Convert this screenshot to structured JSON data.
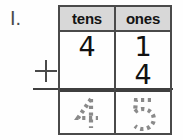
{
  "worksheet": {
    "problem_number": "I.",
    "operator": "+",
    "table": {
      "headers": [
        "tens",
        "ones"
      ],
      "addends": [
        {
          "tens": "4",
          "ones": "1"
        },
        {
          "tens": "",
          "ones": "4"
        }
      ],
      "sum": {
        "tens": "4",
        "ones": "5"
      },
      "sum_style": "dotted-trace"
    },
    "colors": {
      "header_background": "#d8d8d8",
      "border": "#4a4a4a",
      "digit_ink": "#111111",
      "trace_ink": "#8a8a8a",
      "page_background": "#fefefe"
    }
  }
}
